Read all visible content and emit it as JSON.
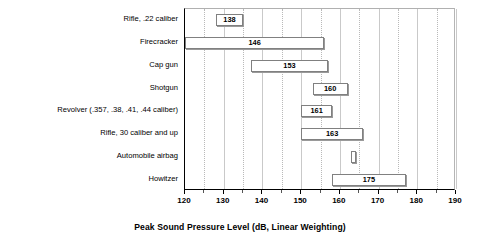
{
  "chart_data": {
    "type": "bar",
    "orientation": "horizontal",
    "subtype": "range-bar",
    "title": "",
    "xlabel": "Peak Sound Pressure Level (dB, Linear Weighting)",
    "ylabel": "",
    "xlim": [
      120,
      190
    ],
    "xticks": [
      120,
      130,
      140,
      150,
      160,
      170,
      180,
      190
    ],
    "xtick_labels": [
      "120",
      "130",
      "140",
      "150",
      "160",
      "170",
      "180",
      "190"
    ],
    "minor_tick_step": 5,
    "grid": true,
    "legend": "none",
    "categories": [
      "Rifle, .22 caliber",
      "Firecracker",
      "Cap gun",
      "Shotgun",
      "Revolver (.357, .38, .41, .44 caliber)",
      "Rifle, 30 caliber and up",
      "Automobile airbag",
      "Howitzer"
    ],
    "bars": [
      {
        "category": "Rifle, .22 caliber",
        "low": 128,
        "high": 135,
        "label": "138"
      },
      {
        "category": "Firecracker",
        "low": 120,
        "high": 156,
        "label": "146"
      },
      {
        "category": "Cap gun",
        "low": 137,
        "high": 157,
        "label": "153"
      },
      {
        "category": "Shotgun",
        "low": 153,
        "high": 162,
        "label": "160"
      },
      {
        "category": "Revolver (.357, .38, .41, .44 caliber)",
        "low": 150,
        "high": 158,
        "label": "161"
      },
      {
        "category": "Rifle, 30 caliber and up",
        "low": 150,
        "high": 166,
        "label": "163"
      },
      {
        "category": "Automobile airbag",
        "low": 163,
        "high": 164,
        "label": ""
      },
      {
        "category": "Howitzer",
        "low": 158,
        "high": 177,
        "label": "175"
      }
    ]
  },
  "colors": {
    "bar_fill": "#ffffff",
    "bar_border": "#808080",
    "gridline": "#c9c9c9",
    "axis": "#000000",
    "text": "#000000",
    "background": "#ffffff"
  }
}
